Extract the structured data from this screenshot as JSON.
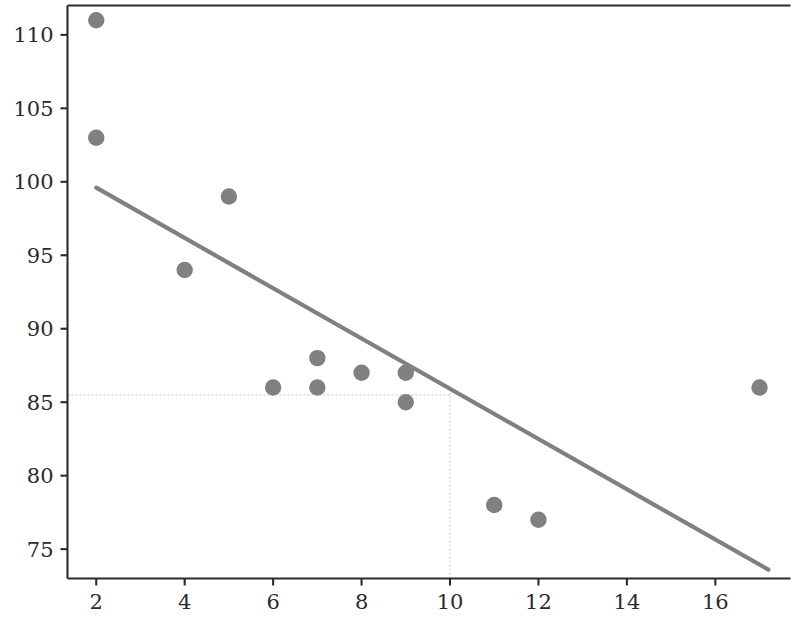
{
  "chart_data": {
    "type": "scatter",
    "title": "",
    "xlabel": "",
    "ylabel": "",
    "xlim": [
      1.35,
      17.7
    ],
    "ylim": [
      73.0,
      112.0
    ],
    "xticks": [
      2,
      4,
      6,
      8,
      10,
      12,
      14,
      16
    ],
    "yticks": [
      75,
      80,
      85,
      90,
      95,
      100,
      105,
      110
    ],
    "xtick_labels": [
      "2",
      "4",
      "6",
      "8",
      "10",
      "12",
      "14",
      "16"
    ],
    "ytick_labels": [
      "75",
      "80",
      "85",
      "90",
      "95",
      "100",
      "105",
      "110"
    ],
    "grid": false,
    "legend": null,
    "marker_color": "#808080",
    "line_color": "#808080",
    "refline_color": "#cfcfcf",
    "axis_color": "#2b2b2b",
    "points": [
      {
        "x": 2,
        "y": 111
      },
      {
        "x": 2,
        "y": 103
      },
      {
        "x": 4,
        "y": 94
      },
      {
        "x": 5,
        "y": 99
      },
      {
        "x": 6,
        "y": 86
      },
      {
        "x": 7,
        "y": 88
      },
      {
        "x": 7,
        "y": 86
      },
      {
        "x": 8,
        "y": 87
      },
      {
        "x": 9,
        "y": 87
      },
      {
        "x": 9,
        "y": 85
      },
      {
        "x": 11,
        "y": 78
      },
      {
        "x": 12,
        "y": 77
      },
      {
        "x": 17,
        "y": 86
      }
    ],
    "series": [
      {
        "name": "observations",
        "type": "scatter",
        "x": [
          2,
          2,
          4,
          5,
          6,
          7,
          7,
          8,
          9,
          9,
          11,
          12,
          17
        ],
        "y": [
          111,
          103,
          94,
          99,
          86,
          88,
          86,
          87,
          87,
          85,
          78,
          77,
          86
        ]
      },
      {
        "name": "regression-line",
        "type": "line",
        "x": [
          2,
          17.2
        ],
        "y": [
          99.6,
          73.6
        ]
      }
    ],
    "regression_line": {
      "x_start": 2,
      "y_start": 99.6,
      "x_end": 17.2,
      "y_end": 73.6,
      "slope": -1.711,
      "intercept": 103.02
    },
    "reference_lines": [
      {
        "orientation": "horizontal",
        "value": 85.5,
        "x_from": 1.35,
        "x_to": 10
      },
      {
        "orientation": "vertical",
        "value": 10,
        "y_from": 73.0,
        "y_to": 85.9
      }
    ],
    "annotations": []
  }
}
